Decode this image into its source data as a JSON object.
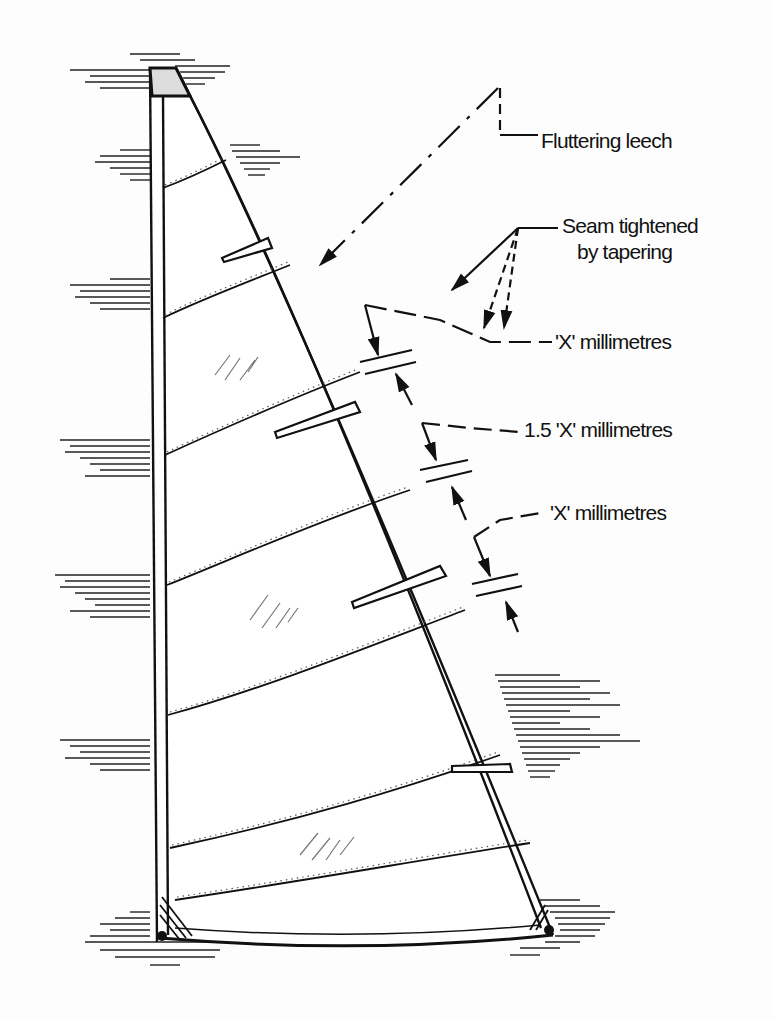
{
  "diagram": {
    "labels": {
      "fluttering_leech": "Fluttering leech",
      "seam_line1": "Seam tightened",
      "seam_line2": "by  tapering",
      "x_mm_top": "'X'   millimetres",
      "x15_mm": "1.5  'X'  millimetres",
      "x_mm_bottom": "'X' millimetres"
    },
    "colors": {
      "ink": "#111111",
      "paper": "#fdfdfd"
    }
  }
}
